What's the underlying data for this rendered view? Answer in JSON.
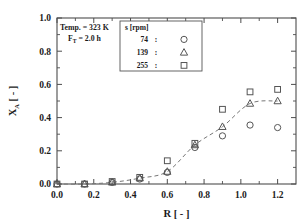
{
  "chart_data": {
    "type": "scatter",
    "title": "",
    "xlabel": "R [ - ]",
    "ylabel": "X_A [ - ]",
    "xlim": [
      0.0,
      1.3
    ],
    "ylim": [
      0.0,
      1.0
    ],
    "xticks": [
      "0.0",
      "0.2",
      "0.4",
      "0.6",
      "0.8",
      "1.0",
      "1.2"
    ],
    "xtick_values": [
      0.0,
      0.2,
      0.4,
      0.6,
      0.8,
      1.0,
      1.2
    ],
    "yticks": [
      "0.0",
      "0.2",
      "0.4",
      "0.6",
      "0.8",
      "1.0"
    ],
    "ytick_values": [
      0.0,
      0.2,
      0.4,
      0.6,
      0.8,
      1.0
    ],
    "grid": false,
    "legend_position": "top-center",
    "series": [
      {
        "name": "74",
        "marker": "circle",
        "x": [
          0.0,
          0.15,
          0.3,
          0.45,
          0.6,
          0.75,
          0.9,
          1.05,
          1.2
        ],
        "y": [
          0.0,
          0.0,
          0.01,
          0.03,
          0.07,
          0.22,
          0.29,
          0.355,
          0.34
        ]
      },
      {
        "name": "139",
        "marker": "triangle",
        "x": [
          0.0,
          0.15,
          0.3,
          0.45,
          0.6,
          0.75,
          0.9,
          1.05,
          1.2
        ],
        "y": [
          0.0,
          0.0,
          0.01,
          0.035,
          0.075,
          0.235,
          0.345,
          0.485,
          0.5
        ]
      },
      {
        "name": "255",
        "marker": "square",
        "x": [
          0.0,
          0.15,
          0.3,
          0.45,
          0.6,
          0.75,
          0.9,
          1.05,
          1.2
        ],
        "y": [
          0.0,
          0.0,
          0.015,
          0.04,
          0.14,
          0.245,
          0.45,
          0.555,
          0.57
        ]
      }
    ],
    "fit_curve": {
      "style": "dashed",
      "x": [
        0.0,
        0.15,
        0.3,
        0.45,
        0.6,
        0.75,
        0.9,
        1.05,
        1.2
      ],
      "y": [
        0.0,
        0.0,
        0.01,
        0.035,
        0.075,
        0.235,
        0.345,
        0.485,
        0.5
      ]
    }
  },
  "annotations": {
    "line1": "Temp. = 323 K",
    "line2_symbol": "F",
    "line2_subscript": "T",
    "line2_value": "= 2.0 h"
  },
  "legend": {
    "title": "s [rpm]",
    "entries": [
      {
        "label": "74",
        "colon": ":",
        "marker": "circle"
      },
      {
        "label": "139",
        "colon": ":",
        "marker": "triangle"
      },
      {
        "label": "255",
        "colon": ":",
        "marker": "square"
      }
    ]
  },
  "axes": {
    "x_title": "R [ - ]",
    "y_title_main": "X",
    "y_title_sub": "A",
    "y_title_rest": "[ - ]"
  },
  "colors": {
    "axis": "#4d4d4d",
    "marker": "#555555",
    "curve": "#777777",
    "text": "#1a1a1a",
    "background": "#ffffff"
  }
}
